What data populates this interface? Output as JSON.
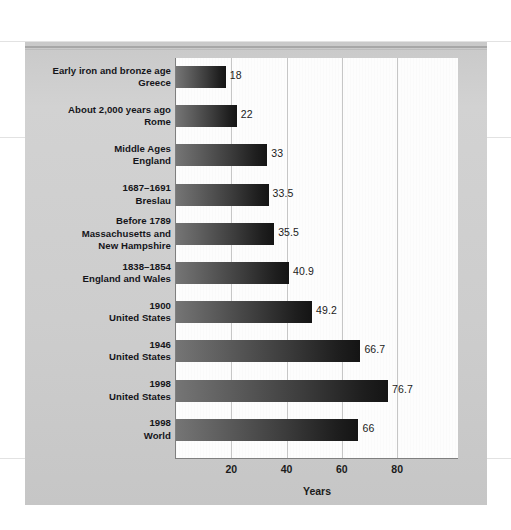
{
  "figure": {
    "axis_title": "Years",
    "background_color": "#cfcfcf",
    "plot_background_color": "#fdfdfd",
    "bar_gradient_from": "#757575",
    "bar_gradient_to": "#141414"
  },
  "chart_data": {
    "type": "bar",
    "orientation": "horizontal",
    "title": "",
    "xlabel": "Years",
    "ylabel": "",
    "xlim": [
      0,
      102
    ],
    "xticks": [
      20,
      40,
      60,
      80
    ],
    "xtick_labels": [
      "20",
      "40",
      "60",
      "80"
    ],
    "grid": true,
    "legend": false,
    "categories": [
      "Early iron and bronze age\nGreece",
      "About 2,000 years ago\nRome",
      "Middle Ages\nEngland",
      "1687–1691\nBreslau",
      "Before 1789\nMassachusetts and\nNew Hampshire",
      "1838–1854\nEngland and Wales",
      "1900\nUnited States",
      "1946\nUnited States",
      "1998\nUnited States",
      "1998\nWorld"
    ],
    "values": [
      18,
      22,
      33,
      33.5,
      35.5,
      40.9,
      49.2,
      66.7,
      76.7,
      66
    ],
    "value_labels": [
      "18",
      "22",
      "33",
      "33.5",
      "35.5",
      "40.9",
      "49.2",
      "66.7",
      "76.7",
      "66"
    ]
  },
  "rows": [
    {
      "period": "Early iron and bronze age",
      "place": "Greece",
      "extra": "",
      "value": 18,
      "label": "18"
    },
    {
      "period": "About 2,000 years ago",
      "place": "Rome",
      "extra": "",
      "value": 22,
      "label": "22"
    },
    {
      "period": "Middle Ages",
      "place": "England",
      "extra": "",
      "value": 33,
      "label": "33"
    },
    {
      "period": "1687–1691",
      "place": "Breslau",
      "extra": "",
      "value": 33.5,
      "label": "33.5"
    },
    {
      "period": "Before 1789",
      "place": "Massachusetts and",
      "extra": "New Hampshire",
      "value": 35.5,
      "label": "35.5"
    },
    {
      "period": "1838–1854",
      "place": "England and Wales",
      "extra": "",
      "value": 40.9,
      "label": "40.9"
    },
    {
      "period": "1900",
      "place": "United States",
      "extra": "",
      "value": 49.2,
      "label": "49.2"
    },
    {
      "period": "1946",
      "place": "United States",
      "extra": "",
      "value": 66.7,
      "label": "66.7"
    },
    {
      "period": "1998",
      "place": "United States",
      "extra": "",
      "value": 76.7,
      "label": "76.7"
    },
    {
      "period": "1998",
      "place": "World",
      "extra": "",
      "value": 66,
      "label": "66"
    }
  ]
}
